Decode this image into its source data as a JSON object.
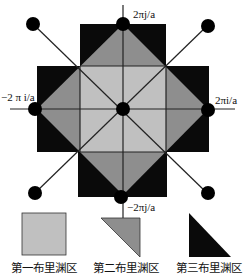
{
  "figure": {
    "colors": {
      "zone1": "#c0c0c0",
      "zone2": "#8e8e8e",
      "zone3": "#0a0a0a",
      "line": "#222222",
      "point": "#000000"
    },
    "axis_labels": {
      "top": "2πj/a",
      "bottom": "−2πj/a",
      "right": "2πi/a",
      "left": "−2 π i/a"
    }
  },
  "legend": [
    {
      "label": "第一布里渊区",
      "shape": "square"
    },
    {
      "label": "第二布里渊区",
      "shape": "triangle-mid"
    },
    {
      "label": "第三布里渊区",
      "shape": "triangle-dark"
    }
  ]
}
